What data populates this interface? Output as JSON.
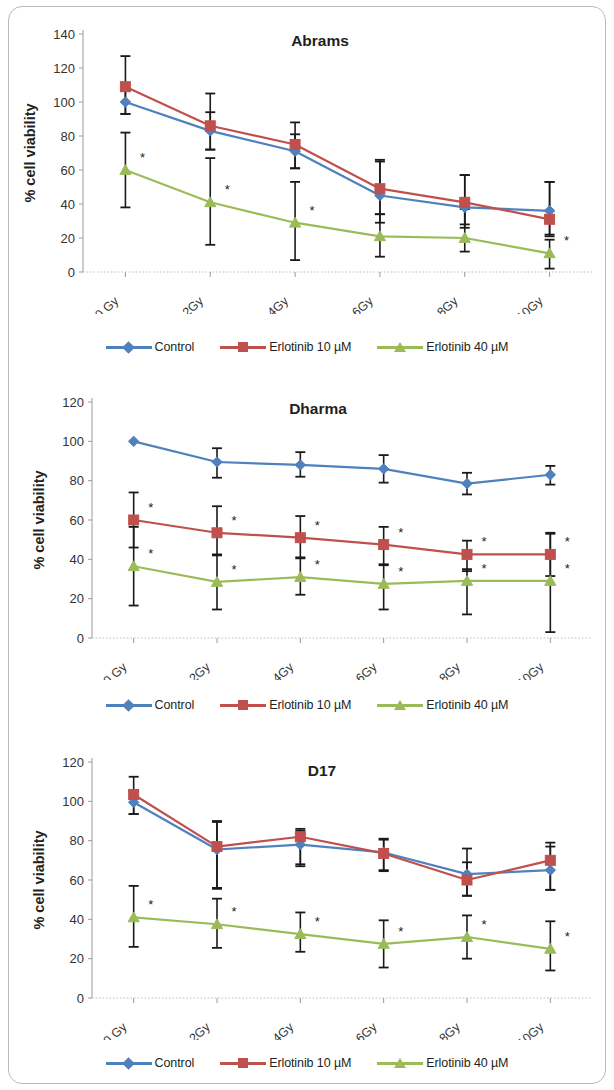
{
  "figure": {
    "series_colors": {
      "control": "#4f81bd",
      "erlotinib10": "#c0504d",
      "erlotinib40": "#9bbb59",
      "error_bar": "#1a1a1a"
    },
    "legend_labels": [
      "Control",
      "Erlotinib 10 µM",
      "Erlotinib 40 µM"
    ],
    "significance_marker": "*"
  },
  "panels": [
    {
      "id": "abrams",
      "title": "Abrams",
      "legend": [
        "Control",
        "Erlotinib 10 µM",
        "Erlotinib 40 µM"
      ]
    },
    {
      "id": "dharma",
      "title": "Dharma",
      "legend": [
        "Control",
        "Erlotinib 10 µM",
        "Erlotinib 40 µM"
      ]
    },
    {
      "id": "d17",
      "title": "D17",
      "legend": [
        "Control",
        "Erlotinib 10 µM",
        "Erlotinib 40 µM"
      ]
    }
  ],
  "chart_data": [
    {
      "type": "line",
      "title": "Abrams",
      "xlabel": "",
      "ylabel": "% cell viability",
      "categories": [
        "0 Gy",
        "2Gy",
        "4Gy",
        "6Gy",
        "8Gy",
        "10Gy"
      ],
      "ylim": [
        0,
        140
      ],
      "yticks": [
        0,
        20,
        40,
        60,
        80,
        100,
        120,
        140
      ],
      "grid": false,
      "legend_position": "bottom",
      "series": [
        {
          "name": "Control",
          "color": "#4f81bd",
          "marker": "diamond",
          "values": [
            100,
            83,
            71,
            45,
            38,
            36
          ],
          "err_low": [
            7,
            11,
            10,
            11,
            10,
            14
          ],
          "err_high": [
            7,
            11,
            10,
            20,
            19,
            17
          ]
        },
        {
          "name": "Erlotinib 10 µM",
          "color": "#c0504d",
          "marker": "square",
          "values": [
            109,
            86,
            75,
            49,
            41,
            31
          ],
          "err_low": [
            16,
            14,
            14,
            20,
            15,
            10
          ],
          "err_high": [
            18,
            19,
            13,
            17,
            16,
            22
          ]
        },
        {
          "name": "Erlotinib 40 µM",
          "color": "#9bbb59",
          "marker": "triangle",
          "values": [
            60,
            41,
            29,
            21,
            20,
            11
          ],
          "err_low": [
            22,
            25,
            22,
            12,
            8,
            9
          ],
          "err_high": [
            22,
            26,
            24,
            13,
            17,
            8
          ]
        }
      ],
      "annotations": [
        {
          "text": "*",
          "series": "Erlotinib 40 µM",
          "category": "0 Gy"
        },
        {
          "text": "*",
          "series": "Erlotinib 40 µM",
          "category": "2Gy"
        },
        {
          "text": "*",
          "series": "Erlotinib 40 µM",
          "category": "4Gy"
        },
        {
          "text": "*",
          "series": "Erlotinib 40 µM",
          "category": "10Gy"
        }
      ]
    },
    {
      "type": "line",
      "title": "Dharma",
      "xlabel": "",
      "ylabel": "% cell viability",
      "categories": [
        "0 Gy",
        "2Gy",
        "4Gy",
        "6Gy",
        "8Gy",
        "10Gy"
      ],
      "ylim": [
        0,
        120
      ],
      "yticks": [
        0,
        20,
        40,
        60,
        80,
        100,
        120
      ],
      "grid": false,
      "legend_position": "bottom",
      "series": [
        {
          "name": "Control",
          "color": "#4f81bd",
          "marker": "diamond",
          "values": [
            100,
            89.5,
            88,
            86,
            78.5,
            83
          ],
          "err_low": [
            0,
            8,
            6,
            7,
            5.5,
            5
          ],
          "err_high": [
            0,
            7,
            6.5,
            7,
            5.5,
            4.5
          ]
        },
        {
          "name": "Erlotinib 10 µM",
          "color": "#c0504d",
          "marker": "square",
          "values": [
            60,
            53.5,
            51,
            47.5,
            42.5,
            42.5
          ],
          "err_low": [
            14,
            11.5,
            10,
            10.5,
            8.5,
            11
          ],
          "err_high": [
            14,
            13.5,
            11,
            9,
            7,
            11
          ]
        },
        {
          "name": "Erlotinib 40 µM",
          "color": "#9bbb59",
          "marker": "triangle",
          "values": [
            36.5,
            28.5,
            31,
            27.5,
            29,
            29
          ],
          "err_low": [
            20,
            14,
            9,
            13,
            17,
            26
          ],
          "err_high": [
            20,
            14,
            9.5,
            10,
            6,
            24
          ]
        }
      ],
      "annotations": [
        {
          "text": "*",
          "series": "Erlotinib 10 µM",
          "category": "0 Gy"
        },
        {
          "text": "*",
          "series": "Erlotinib 10 µM",
          "category": "2Gy"
        },
        {
          "text": "*",
          "series": "Erlotinib 10 µM",
          "category": "4Gy"
        },
        {
          "text": "*",
          "series": "Erlotinib 10 µM",
          "category": "6Gy"
        },
        {
          "text": "*",
          "series": "Erlotinib 10 µM",
          "category": "8Gy"
        },
        {
          "text": "*",
          "series": "Erlotinib 10 µM",
          "category": "10Gy"
        },
        {
          "text": "*",
          "series": "Erlotinib 40 µM",
          "category": "0 Gy"
        },
        {
          "text": "*",
          "series": "Erlotinib 40 µM",
          "category": "2Gy"
        },
        {
          "text": "*",
          "series": "Erlotinib 40 µM",
          "category": "4Gy"
        },
        {
          "text": "*",
          "series": "Erlotinib 40 µM",
          "category": "6Gy"
        },
        {
          "text": "*",
          "series": "Erlotinib 40 µM",
          "category": "8Gy"
        },
        {
          "text": "*",
          "series": "Erlotinib 40 µM",
          "category": "10Gy"
        }
      ]
    },
    {
      "type": "line",
      "title": "D17",
      "xlabel": "",
      "ylabel": "% cell viability",
      "categories": [
        "0 Gy",
        "2Gy",
        "4Gy",
        "6Gy",
        "8Gy",
        "10Gy"
      ],
      "ylim": [
        0,
        120
      ],
      "yticks": [
        0,
        20,
        40,
        60,
        80,
        100,
        120
      ],
      "grid": false,
      "legend_position": "bottom",
      "series": [
        {
          "name": "Control",
          "color": "#4f81bd",
          "marker": "diamond",
          "values": [
            99.5,
            75.5,
            78,
            74,
            63,
            65
          ],
          "err_low": [
            6,
            20,
            10,
            9,
            11,
            10
          ],
          "err_high": [
            6,
            14,
            7,
            7,
            6,
            12
          ]
        },
        {
          "name": "Erlotinib 10 µM",
          "color": "#c0504d",
          "marker": "square",
          "values": [
            103.5,
            77,
            82,
            73.5,
            60,
            70
          ],
          "err_low": [
            10,
            21,
            15,
            9,
            8,
            15
          ],
          "err_high": [
            9,
            13,
            4,
            7,
            16,
            9
          ]
        },
        {
          "name": "Erlotinib 40 µM",
          "color": "#9bbb59",
          "marker": "triangle",
          "values": [
            41,
            37.5,
            32.5,
            27.5,
            31,
            25
          ],
          "err_low": [
            15,
            12,
            9,
            12,
            11,
            11
          ],
          "err_high": [
            16,
            13,
            11,
            12,
            11,
            14
          ]
        }
      ],
      "annotations": [
        {
          "text": "*",
          "series": "Erlotinib 40 µM",
          "category": "0 Gy"
        },
        {
          "text": "*",
          "series": "Erlotinib 40 µM",
          "category": "2Gy"
        },
        {
          "text": "*",
          "series": "Erlotinib 40 µM",
          "category": "4Gy"
        },
        {
          "text": "*",
          "series": "Erlotinib 40 µM",
          "category": "6Gy"
        },
        {
          "text": "*",
          "series": "Erlotinib 40 µM",
          "category": "8Gy"
        },
        {
          "text": "*",
          "series": "Erlotinib 40 µM",
          "category": "10Gy"
        }
      ]
    }
  ]
}
